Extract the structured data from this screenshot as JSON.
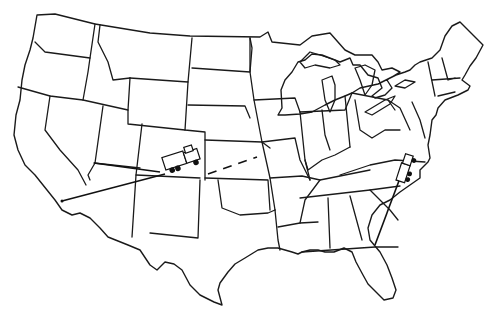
{
  "map": {
    "title": "",
    "type": "outline-map",
    "region": "Contiguous United States",
    "style": "hand-drawn line art",
    "stroke_color": "#1a1a1a",
    "background": "#ffffff"
  },
  "routes": [
    {
      "name": "route-west",
      "style": "solid",
      "from": [
        62,
        201
      ],
      "to": [
        165,
        174
      ]
    },
    {
      "name": "route-utah-arizona",
      "style": "solid",
      "from": [
        94,
        163
      ],
      "to": [
        160,
        172
      ]
    },
    {
      "name": "route-kansas",
      "style": "dashed",
      "from": [
        208,
        174
      ],
      "to": [
        257,
        157
      ]
    },
    {
      "name": "route-southeast",
      "style": "solid",
      "from": [
        375,
        245
      ],
      "to": [
        400,
        178
      ]
    }
  ],
  "markers": [
    {
      "name": "truck-west",
      "icon": "truck-icon",
      "x": 160,
      "y": 152,
      "rotation": -18
    },
    {
      "name": "truck-east",
      "icon": "truck-icon",
      "x": 398,
      "y": 150,
      "rotation": -70
    }
  ]
}
